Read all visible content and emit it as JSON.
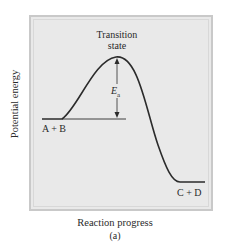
{
  "diagram": {
    "y_axis_label": "Potential energy",
    "x_axis_label": "Reaction progress",
    "caption": "(a)",
    "labels": {
      "transition_line1": "Transition",
      "transition_line2": "state",
      "activation_energy": "E",
      "activation_energy_sub": "a",
      "reactants": "A + B",
      "products": "C + D"
    },
    "colors": {
      "curve": "#2b2b2b",
      "background": "#e9e9e9",
      "border": "#c9c9c9"
    }
  }
}
